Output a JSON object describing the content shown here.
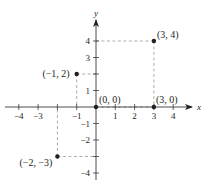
{
  "chart_data": {
    "type": "scatter",
    "title": "",
    "xlabel": "x",
    "ylabel": "y",
    "xlim": [
      -4.6,
      4.9
    ],
    "ylim": [
      -4.5,
      5.2
    ],
    "grid": false,
    "x_ticks": [
      -4,
      -3,
      -2,
      -1,
      1,
      2,
      3,
      4
    ],
    "x_tick_labels": [
      "−4",
      "−3",
      "",
      "−1",
      "1",
      "2",
      "3",
      "4"
    ],
    "y_ticks": [
      -4,
      -3,
      -2,
      -1,
      1,
      2,
      3,
      4
    ],
    "y_tick_labels": [
      "−4",
      "",
      "−2",
      "−1",
      "1",
      "",
      "3",
      "4"
    ],
    "points": [
      {
        "x": -1,
        "y": 2,
        "label": "(−1, 2)"
      },
      {
        "x": 3,
        "y": 4,
        "label": "(3, 4)"
      },
      {
        "x": 0,
        "y": 0,
        "label": "(0, 0)"
      },
      {
        "x": 3,
        "y": 0,
        "label": "(3, 0)"
      },
      {
        "x": -2,
        "y": -3,
        "label": "(−2, −3)"
      }
    ],
    "guides": "dashed projection lines from each point to both axes"
  },
  "colors": {
    "ink": "#231f20",
    "guide": "#8a8a8a"
  }
}
